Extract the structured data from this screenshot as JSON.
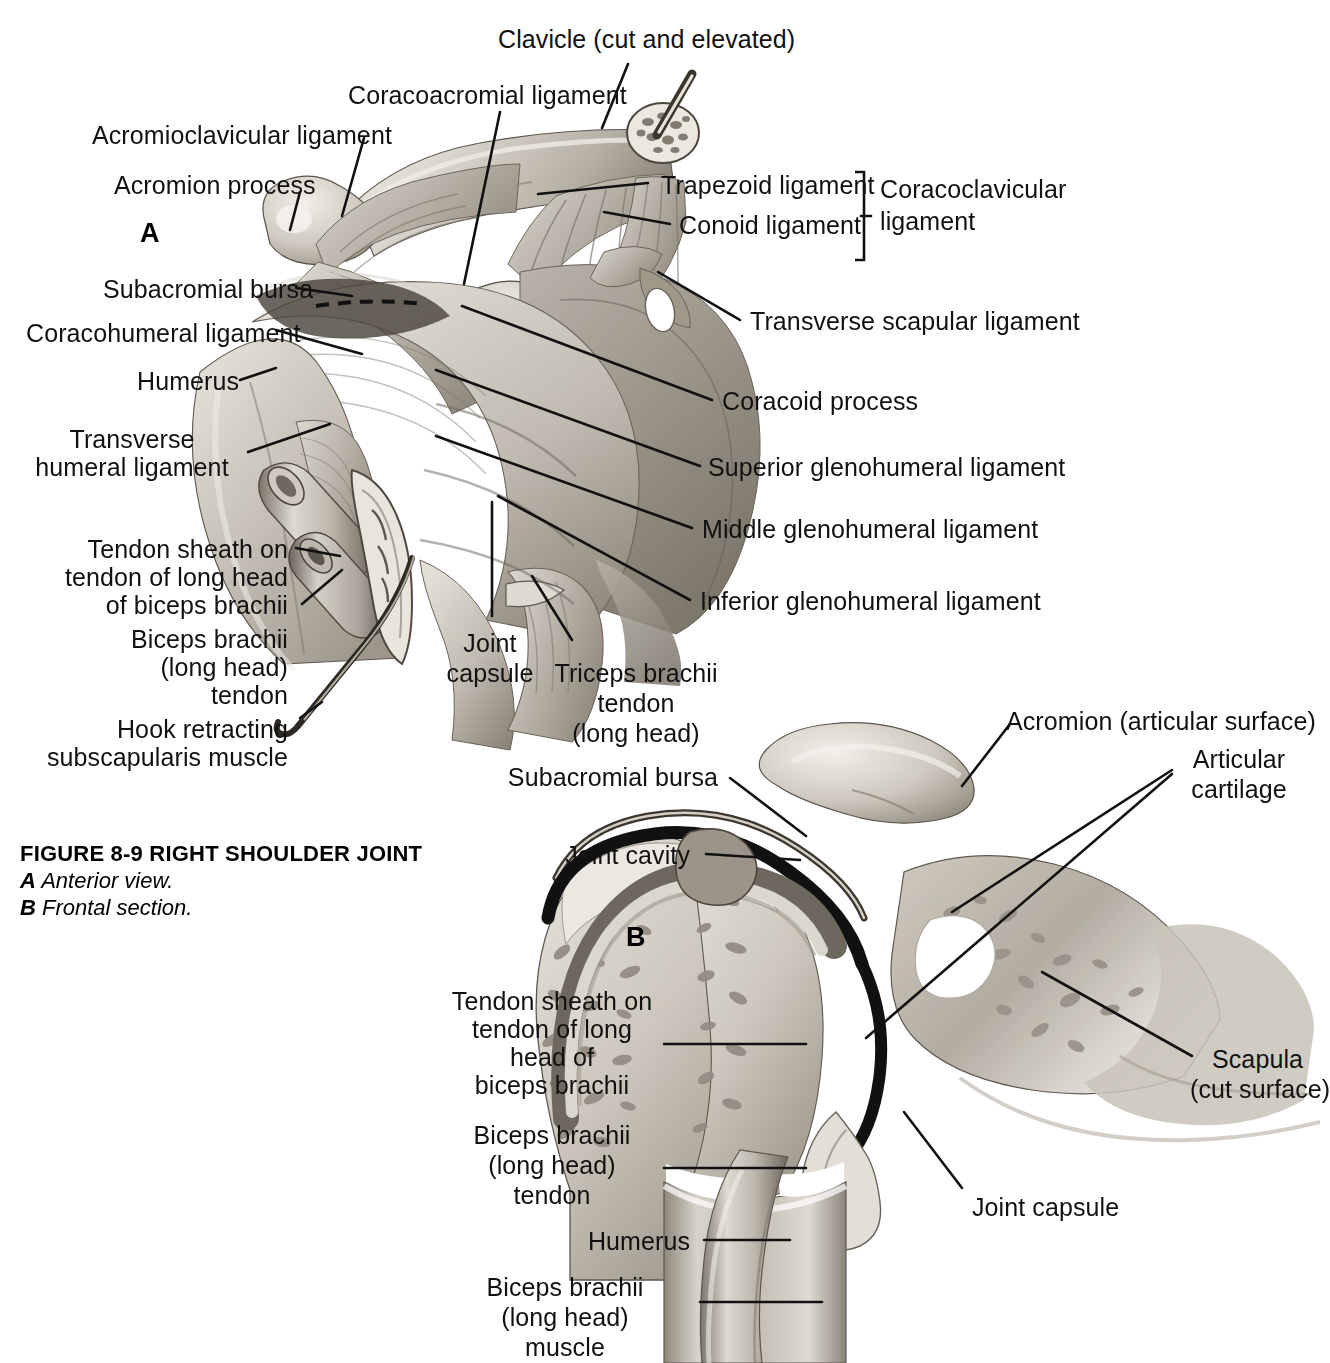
{
  "figure": {
    "caption_title": "FIGURE 8-9 RIGHT SHOULDER JOINT",
    "caption_a_letter": "A",
    "caption_a_text": "Anterior view.",
    "caption_b_letter": "B",
    "caption_b_text": "Frontal section.",
    "panel_a_letter": "A",
    "panel_b_letter": "B"
  },
  "panel_a": {
    "labels": {
      "clavicle": "Clavicle (cut and elevated)",
      "coracoacromial_ligament": "Coracoacromial ligament",
      "acromioclavicular_ligament": "Acromioclavicular ligament",
      "acromion_process": "Acromion process",
      "trapezoid_ligament": "Trapezoid ligament",
      "conoid_ligament": "Conoid ligament",
      "coracoclavicular_ligament_l1": "Coracoclavicular",
      "coracoclavicular_ligament_l2": "ligament",
      "subacromial_bursa": "Subacromial bursa",
      "coracohumeral_ligament": "Coracohumeral ligament",
      "humerus": "Humerus",
      "transverse_humeral_ligament_l1": "Transverse",
      "transverse_humeral_ligament_l2": "humeral ligament",
      "transverse_scapular_ligament": "Transverse scapular ligament",
      "coracoid_process": "Coracoid process",
      "superior_glenohumeral_ligament": "Superior glenohumeral ligament",
      "middle_glenohumeral_ligament": "Middle glenohumeral ligament",
      "inferior_glenohumeral_ligament": "Inferior glenohumeral ligament",
      "tendon_sheath_l1": "Tendon sheath on",
      "tendon_sheath_l2": "tendon of long head",
      "tendon_sheath_l3": "of biceps brachii",
      "biceps_tendon_l1": "Biceps brachii",
      "biceps_tendon_l2": "(long head)",
      "biceps_tendon_l3": "tendon",
      "hook_l1": "Hook retracting",
      "hook_l2": "subscapularis muscle",
      "joint_capsule_l1": "Joint",
      "joint_capsule_l2": "capsule",
      "triceps_l1": "Triceps brachii",
      "triceps_l2": "tendon",
      "triceps_l3": "(long head)"
    }
  },
  "panel_b": {
    "labels": {
      "acromion": "Acromion (articular surface)",
      "articular_cartilage_l1": "Articular",
      "articular_cartilage_l2": "cartilage",
      "subacromial_bursa": "Subacromial bursa",
      "joint_cavity": "Joint cavity",
      "scapula_l1": "Scapula",
      "scapula_l2": "(cut surface)",
      "joint_capsule": "Joint capsule",
      "tendon_sheath_l1": "Tendon sheath on",
      "tendon_sheath_l2": "tendon of long",
      "tendon_sheath_l3": "head of",
      "tendon_sheath_l4": "biceps brachii",
      "biceps_tendon_l1": "Biceps brachii",
      "biceps_tendon_l2": "(long head)",
      "biceps_tendon_l3": "tendon",
      "humerus": "Humerus",
      "biceps_muscle_l1": "Biceps brachii",
      "biceps_muscle_l2": "(long head)",
      "biceps_muscle_l3": "muscle"
    }
  },
  "colors": {
    "ink": "#111111",
    "background": "#ffffff",
    "bone_light": "#d8d4cd",
    "bone_mid": "#b3ada4",
    "bone_dark": "#8a8278",
    "cavity_black": "#121212"
  }
}
